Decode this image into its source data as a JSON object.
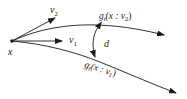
{
  "diagram": {
    "point_label": "x",
    "vectors": [
      {
        "name": "v1",
        "label_main": "v",
        "label_sub": "1"
      },
      {
        "name": "v2",
        "label_main": "v",
        "label_sub": "2"
      }
    ],
    "curves": [
      {
        "name": "upper",
        "label_main": "g",
        "label_sub": "t",
        "label_args": "(x : v",
        "label_args_sub": "2",
        "label_close": ")"
      },
      {
        "name": "lower",
        "label_main": "g",
        "label_sub": "t",
        "label_args": "(x : v",
        "label_args_sub": "1",
        "label_close": ")"
      }
    ],
    "distance_label": "d",
    "stroke_color": "#1a1a1a"
  }
}
